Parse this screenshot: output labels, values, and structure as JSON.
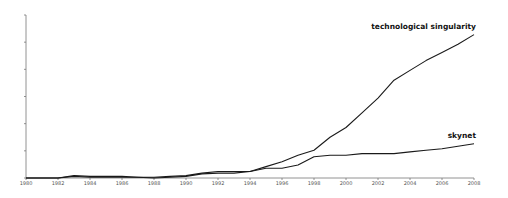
{
  "chart_data": {
    "type": "line",
    "title": "",
    "xlabel": "",
    "ylabel": "",
    "x": [
      1980,
      1981,
      1982,
      1983,
      1984,
      1985,
      1986,
      1987,
      1988,
      1989,
      1990,
      1991,
      1992,
      1993,
      1994,
      1995,
      1996,
      1997,
      1998,
      1999,
      2000,
      2001,
      2002,
      2003,
      2004,
      2005,
      2006,
      2007,
      2008
    ],
    "x_tick_labels": [
      "1980",
      "1982",
      "1984",
      "1986",
      "1988",
      "1990",
      "1992",
      "1994",
      "1996",
      "1998",
      "2000",
      "2002",
      "2004",
      "2006",
      "2008"
    ],
    "y_ticks_count": 7,
    "y_tick_labels_visible": false,
    "ylim": [
      0,
      100
    ],
    "grid": false,
    "legend": "inline labels at line ends",
    "series": [
      {
        "name": "technological singularity",
        "values": [
          0,
          0,
          0,
          1.5,
          1,
          1,
          1,
          0.5,
          0.5,
          1,
          1.5,
          3,
          4,
          4,
          4,
          7,
          10,
          14,
          17,
          25,
          31,
          40,
          49,
          60,
          66,
          72,
          77,
          82,
          88
        ]
      },
      {
        "name": "skynet",
        "values": [
          0,
          0,
          0,
          1,
          0.5,
          0.5,
          0.5,
          0.5,
          0,
          0.5,
          1,
          2.5,
          3,
          3,
          4,
          6,
          6,
          8,
          13,
          14,
          14,
          15,
          15,
          15,
          16,
          17,
          18,
          19.5,
          21
        ]
      }
    ]
  }
}
